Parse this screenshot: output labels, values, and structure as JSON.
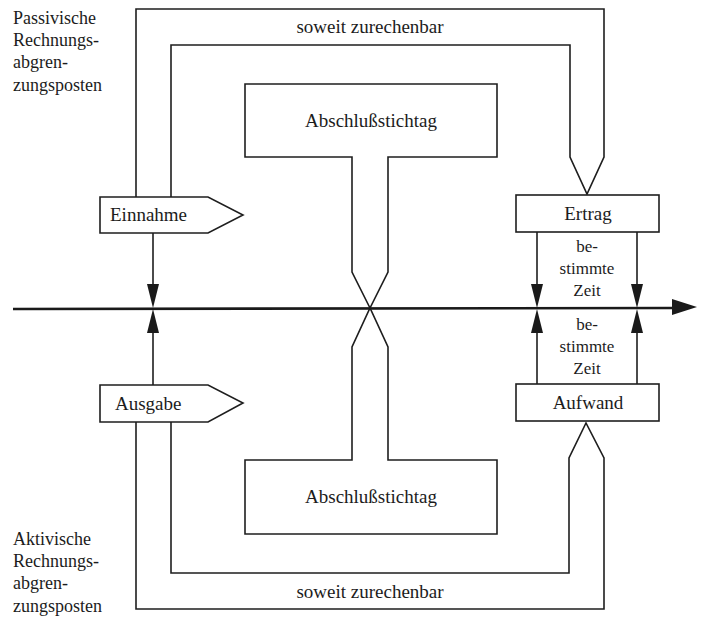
{
  "diagram": {
    "colors": {
      "line": "#1e1e1e",
      "background": "#ffffff"
    },
    "corner_labels": {
      "top_left": [
        "Passivische",
        "Rechnungs-",
        "abgren-",
        "zungsposten"
      ],
      "bottom_left": [
        "Aktivische",
        "Rechnungs-",
        "abgren-",
        "zungsposten"
      ]
    },
    "paths": {
      "top_label": "soweit zurechenbar",
      "bottom_label": "soweit zurechenbar"
    },
    "boxes": {
      "top_cutoff": "Abschlußstichtag",
      "bottom_cutoff": "Abschlußstichtag",
      "income": "Einnahme",
      "expenditure": "Ausgabe",
      "revenue": "Ertrag",
      "expense": "Aufwand"
    },
    "period_labels": {
      "upper": [
        "be-",
        "stimmte",
        "Zeit"
      ],
      "lower": [
        "be-",
        "stimmte",
        "Zeit"
      ]
    },
    "axis": {
      "direction": "time",
      "arrow": "right"
    }
  }
}
